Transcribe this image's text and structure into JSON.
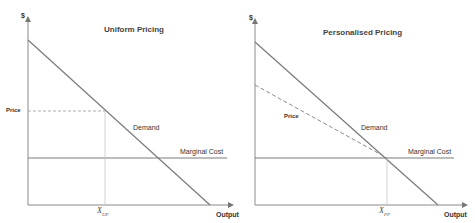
{
  "left_panel": {
    "title": "Uniform Pricing",
    "y_axis_label": "$",
    "x_axis_label": "Output",
    "price_label": "Price",
    "demand_label": "Demand",
    "mc_label": "Marginal Cost",
    "quantity_label": "X",
    "quantity_sub": "UP"
  },
  "right_panel": {
    "title": "Personalised Pricing",
    "y_axis_label": "$",
    "x_axis_label": "Output",
    "price_label": "Price",
    "demand_label": "Demand",
    "mc_label": "Marginal Cost",
    "quantity_label": "X",
    "quantity_sub": "PP"
  },
  "colors": {
    "line": "#7a7a7a",
    "dashed": "#8a8a8a",
    "guide": "#c8c8c8",
    "text": "#333333"
  }
}
